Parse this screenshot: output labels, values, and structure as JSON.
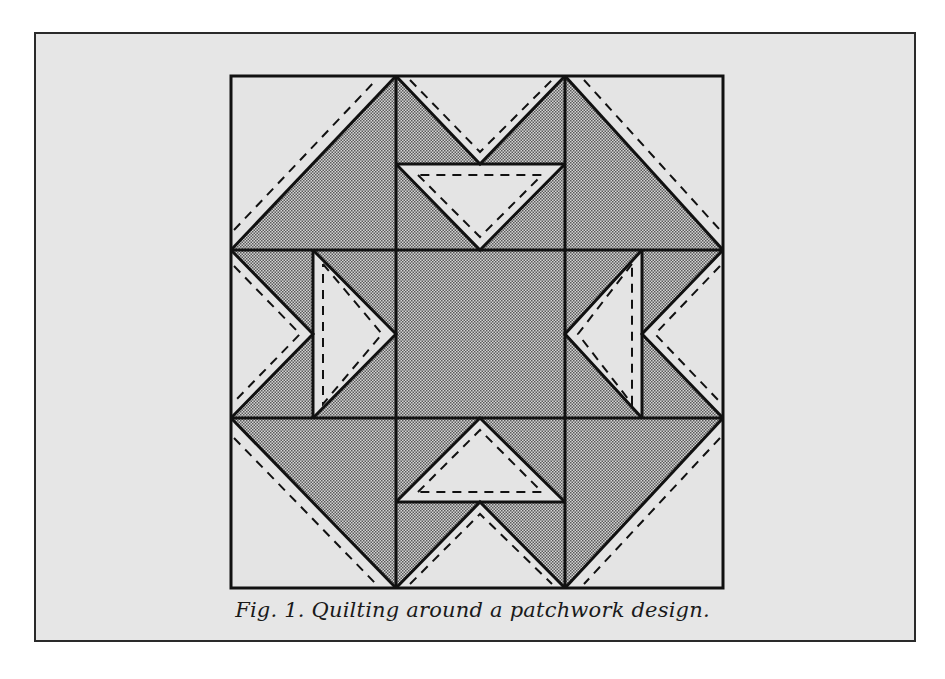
{
  "figure": {
    "caption": "Fig. 1. Quilting around a patchwork design.",
    "colors": {
      "panel_background": "#e6e6e6",
      "light_patch": "#e4e4e4",
      "shaded_patch": "#b9b9b9",
      "outline": "#111111",
      "stitch_line": "#111111"
    }
  }
}
